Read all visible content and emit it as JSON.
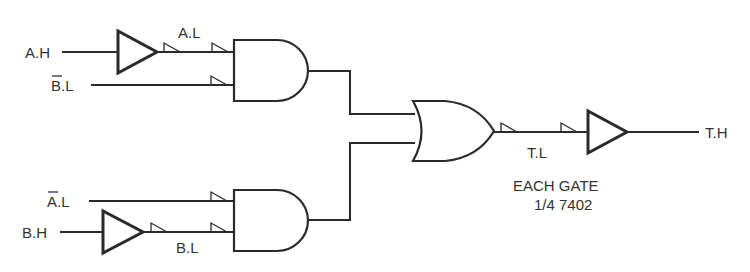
{
  "diagram": {
    "signals": {
      "a_h": "A.H",
      "a_l": "A.L",
      "bbar_l": "B.L",
      "abar_l": "A.L",
      "b_h": "B.H",
      "b_l": "B.L",
      "t_l": "T.L",
      "t_h": "T.H"
    },
    "note": {
      "line1": "EACH GATE",
      "line2": "1/4 7402"
    },
    "components": [
      {
        "type": "buffer",
        "id": "buf-a",
        "input": "A.H",
        "output": "A.L"
      },
      {
        "type": "and",
        "id": "and-1",
        "inputs": [
          "A.L",
          "B̄.L"
        ]
      },
      {
        "type": "buffer",
        "id": "buf-b",
        "input": "B.H",
        "output": "B.L"
      },
      {
        "type": "and",
        "id": "and-2",
        "inputs": [
          "Ā.L",
          "B.L"
        ]
      },
      {
        "type": "or",
        "id": "or-1",
        "inputs": [
          "and-1",
          "and-2"
        ],
        "output": "T.L"
      },
      {
        "type": "buffer",
        "id": "buf-t",
        "input": "T.L",
        "output": "T.H"
      }
    ]
  }
}
